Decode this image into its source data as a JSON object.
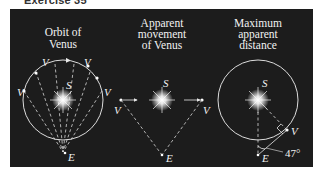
{
  "header": {
    "title": "Exercise 35"
  },
  "panels": [
    {
      "caption_lines": [
        "Orbit of",
        "Venus"
      ],
      "labels": {
        "venus": "V",
        "sun": "S",
        "earth": "E"
      }
    },
    {
      "caption_lines": [
        "Apparent",
        "movement",
        "of Venus"
      ],
      "labels": {
        "venus": "V",
        "sun": "S",
        "earth": "E"
      }
    },
    {
      "caption_lines": [
        "Maximum",
        "apparent",
        "distance"
      ],
      "labels": {
        "venus": "V",
        "sun": "S",
        "earth": "E",
        "angle": "47°"
      }
    }
  ],
  "colors": {
    "background": "#1c1c1c",
    "line": "#e8e8e8",
    "text": "#f2f2f2"
  }
}
